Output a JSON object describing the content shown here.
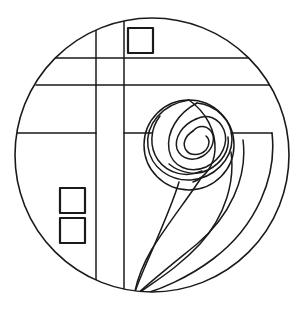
{
  "artwork": {
    "title": "Mackintosh Rose Stained Glass Pattern",
    "medium": "line-art-coloring-page",
    "style": "Glasgow School / Charles Rennie Mackintosh rose",
    "background_color": "#ffffff",
    "line_color": "#1a1a1a",
    "canvas": {
      "width": 305,
      "height": 309
    }
  },
  "geometry": {
    "outer_circle": {
      "name": "outer-circle-border",
      "cx": 152,
      "cy": 155,
      "r": 138,
      "stroke_width": 1.6
    },
    "vertical_lines": [
      {
        "name": "vertical-line-left",
        "x": 96,
        "y1": 29,
        "y2": 290,
        "stroke_width": 1.5
      },
      {
        "name": "vertical-line-right",
        "x": 124,
        "y1": 19,
        "y2": 294,
        "stroke_width": 1.5
      }
    ],
    "horizontal_lines": [
      {
        "name": "horizontal-line-upper",
        "y": 58,
        "x1": 53,
        "x2": 256,
        "stroke_width": 1.5
      },
      {
        "name": "horizontal-line-lower",
        "y": 85,
        "x1": 36,
        "x2": 279,
        "stroke_width": 1.5
      },
      {
        "name": "horizontal-line-mid-left",
        "y": 133,
        "x1": 15,
        "x2": 96,
        "stroke_width": 1.5
      },
      {
        "name": "horizontal-line-mid-center",
        "y": 133,
        "x1": 124,
        "x2": 152,
        "stroke_width": 1.5
      },
      {
        "name": "horizontal-line-mid-right",
        "y": 133,
        "x1": 231,
        "x2": 272,
        "stroke_width": 1.5
      }
    ],
    "squares": [
      {
        "name": "square-top",
        "x": 128,
        "y": 28,
        "size": 25,
        "stroke_width": 2.2
      },
      {
        "name": "square-lower-upper",
        "x": 60,
        "y": 188,
        "size": 25,
        "stroke_width": 2.2
      },
      {
        "name": "square-lower-lower",
        "x": 60,
        "y": 218,
        "size": 25,
        "stroke_width": 2.2
      }
    ],
    "rose": {
      "name": "mackintosh-rose",
      "cx": 189,
      "cy": 145,
      "outer_radius": 45,
      "petal_count": 6,
      "stroke_width": 1.5
    },
    "stem_curves": [
      {
        "name": "stem-curve-inner",
        "stroke_width": 1.5
      },
      {
        "name": "stem-curve-middle",
        "stroke_width": 1.5
      },
      {
        "name": "stem-curve-outer",
        "stroke_width": 1.5
      }
    ],
    "leaf": {
      "name": "leaf-shape",
      "stroke_width": 1.6
    }
  },
  "paths": {
    "rose_outer_circle": "M 189 100 A 45 45 0 1 1 188.9 100",
    "rose_petal_1": "M 189 100 C 163 104 146 124 148 146 C 150 166 168 180 189 179 C 212 178 231 161 231 140 C 231 121 216 106 197 103",
    "rose_petal_2": "M 197 103 C 179 113 167 131 170 149 C 173 166 190 173 206 166 C 221 159 228 143 223 130 C 219 118 207 113 196 118",
    "rose_petal_3": "M 196 118 C 183 124 175 137 178 148 C 181 158 193 161 203 155 C 212 149 215 138 210 131 C 206 125 198 125 193 130",
    "rose_petal_4": "M 193 130 C 185 135 182 143 186 149 C 190 155 199 155 205 149 C 209 144 209 138 205 135",
    "rose_inner_1": "M 161 115 C 151 128 150 145 158 158 C 167 172 186 177 201 170",
    "rose_inner_2": "M 170 163 C 180 172 195 175 207 170 C 221 164 229 151 227 138",
    "stem_inner": "M 179 182 C 172 205 156 240 143 268 C 138 280 135 290 134 296",
    "stem_middle": "M 200 178 C 188 196 168 222 152 248 C 142 265 136 283 134 296",
    "stem_outer": "M 231 152 C 234 180 226 214 200 243 C 176 270 150 283 135 296",
    "leaf_outer": "M 272 133 C 276 175 256 225 213 258 C 189 277 160 291 135 296",
    "leaf_inner": "M 244 140 C 248 178 230 216 197 243 C 175 261 152 280 135 296"
  },
  "labels": {
    "pattern_name": "Mackintosh Rose"
  }
}
